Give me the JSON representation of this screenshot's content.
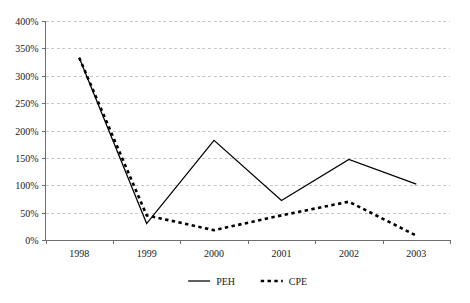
{
  "chart_data": {
    "type": "line",
    "title": "",
    "subtitle": "",
    "xlabel": "",
    "ylabel": "",
    "categories": [
      "1998",
      "1999",
      "2000",
      "2001",
      "2002",
      "2003"
    ],
    "ylim": [
      0,
      400
    ],
    "ytick_step": 50,
    "ytick_labels": [
      "0%",
      "50%",
      "100%",
      "150%",
      "200%",
      "250%",
      "300%",
      "350%",
      "400%"
    ],
    "ytick_values": [
      0,
      50,
      100,
      150,
      200,
      250,
      300,
      350,
      400
    ],
    "grid": true,
    "grid_axis": "y",
    "legend_position": "bottom-center",
    "series": [
      {
        "name": "PEH",
        "style": "solid",
        "color": "#000000",
        "values": [
          333,
          30,
          182,
          72,
          147,
          102
        ]
      },
      {
        "name": "CPE",
        "style": "dotted",
        "color": "#000000",
        "values": [
          333,
          45,
          18,
          45,
          70,
          8
        ]
      }
    ]
  },
  "legend": {
    "items": [
      {
        "label": "PEH",
        "style": "solid"
      },
      {
        "label": "CPE",
        "style": "dotted"
      }
    ]
  }
}
